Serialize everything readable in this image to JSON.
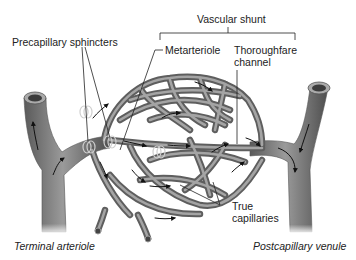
{
  "diagram": {
    "labels": {
      "vascular_shunt": "Vascular shunt",
      "precapillary_sphincters": "Precapillary sphincters",
      "metarteriole": "Metarteriole",
      "thoroughfare_channel_line1": "Thoroughfare",
      "thoroughfare_channel_line2": "channel",
      "true_capillaries_line1": "True",
      "true_capillaries_line2": "capillaries",
      "terminal_arteriole": "Terminal arteriole",
      "postcapillary_venule": "Postcapillary venule"
    },
    "colors": {
      "vessel": "#7d7d7d",
      "vessel_dark": "#4a4a4a",
      "vessel_light": "#b5b5b5",
      "lumen": "#3c3c3c",
      "leader_line": "#222222",
      "text": "#222222",
      "background": "#ffffff"
    }
  }
}
